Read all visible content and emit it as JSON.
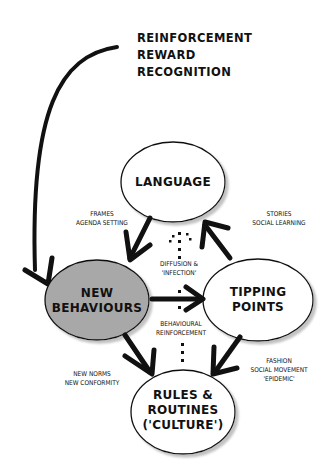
{
  "diagram": {
    "top_labels": [
      "REINFORCEMENT",
      "REWARD",
      "RECOGNITION"
    ],
    "nodes": {
      "language": {
        "label": "LANGUAGE"
      },
      "new_behaviours": {
        "line1": "NEW",
        "line2": "BEHAVIOURS",
        "fill": "#a8a8a8"
      },
      "tipping_points": {
        "line1": "TIPPING",
        "line2": "POINTS"
      },
      "rules_routines": {
        "line1": "RULES &",
        "line2": "ROUTINES",
        "line3": "('CULTURE')"
      }
    },
    "edge_labels": {
      "frames": {
        "line1": "FRAMES",
        "line2": "AGENDA SETTING"
      },
      "stories": {
        "line1": "STORIES",
        "line2": "SOCIAL LEARNING"
      },
      "diffusion": {
        "line1": "DIFFUSION &",
        "line2": "'INFECTION'"
      },
      "behavioural": {
        "line1": "BEHAVIOURAL",
        "line2": "REINFORCEMENT"
      },
      "new_norms": {
        "line1": "NEW NORMS",
        "line2": "NEW CONFORMITY"
      },
      "fashion": {
        "line1": "FASHION",
        "line2": "SOCIAL MOVEMENT",
        "line3": "'EPIDEMIC'"
      }
    }
  }
}
